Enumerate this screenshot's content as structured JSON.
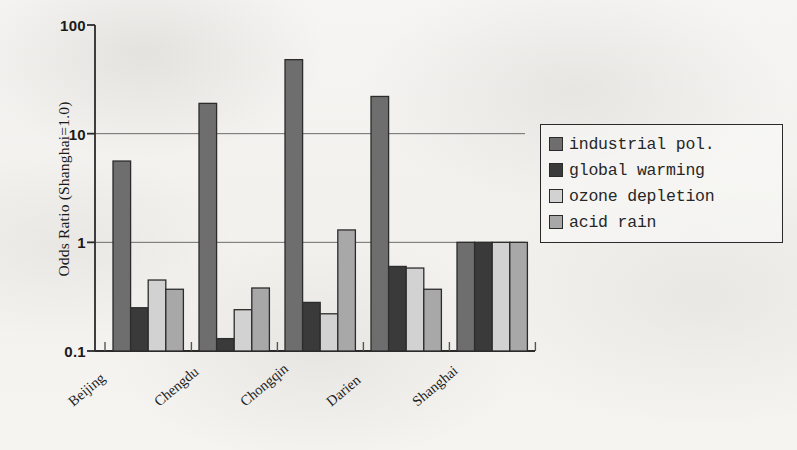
{
  "chart_data": {
    "type": "bar",
    "title": "",
    "xlabel": "",
    "ylabel": "Odds Ratio (Shanghai=1.0)",
    "yscale": "log",
    "ylim": [
      0.1,
      100
    ],
    "ytick_labels": [
      "100",
      "10",
      "1",
      "0.1"
    ],
    "ytick_values": [
      100,
      10,
      1,
      0.1
    ],
    "grid": "horizontal",
    "legend_position": "right",
    "categories": [
      "Beijing",
      "Chengdu",
      "Chongqin",
      "Darien",
      "Shanghai"
    ],
    "series": [
      {
        "name": "industrial pol.",
        "color": "#6e6e6e",
        "values": [
          5.6,
          19.0,
          48.0,
          22.0,
          1.0
        ]
      },
      {
        "name": "global warming",
        "color": "#3a3a3a",
        "values": [
          0.25,
          0.13,
          0.28,
          0.6,
          1.0
        ]
      },
      {
        "name": "ozone depletion",
        "color": "#d2d2d2",
        "values": [
          0.45,
          0.24,
          0.22,
          0.58,
          1.0
        ]
      },
      {
        "name": "acid rain",
        "color": "#a8a8a8",
        "values": [
          0.37,
          0.38,
          1.3,
          0.37,
          1.0
        ]
      }
    ]
  },
  "axis": {
    "ylabel": "Odds Ratio (Shanghai=1.0)",
    "ticks": [
      {
        "label": "100"
      },
      {
        "label": "10"
      },
      {
        "label": "1"
      },
      {
        "label": "0.1"
      }
    ]
  },
  "legend": {
    "items": [
      {
        "label": "industrial pol.",
        "color": "#6e6e6e"
      },
      {
        "label": "global warming",
        "color": "#3a3a3a"
      },
      {
        "label": "ozone depletion",
        "color": "#d2d2d2"
      },
      {
        "label": "acid rain",
        "color": "#a8a8a8"
      }
    ]
  },
  "xaxis": {
    "labels": [
      "Beijing",
      "Chengdu",
      "Chongqin",
      "Darien",
      "Shanghai"
    ]
  }
}
